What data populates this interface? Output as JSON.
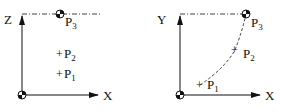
{
  "left_panel": {
    "axis_vertical": "Z",
    "axis_horizontal": "X",
    "points": [
      {
        "label": "P",
        "sub": "1",
        "marker": "plus"
      },
      {
        "label": "P",
        "sub": "2",
        "marker": "plus"
      },
      {
        "label": "P",
        "sub": "3",
        "marker": "target"
      }
    ]
  },
  "right_panel": {
    "axis_vertical": "Y",
    "axis_horizontal": "X",
    "points": [
      {
        "label": "P",
        "sub": "1",
        "marker": "plus"
      },
      {
        "label": "P",
        "sub": "2",
        "marker": "plus"
      },
      {
        "label": "P",
        "sub": "3",
        "marker": "target"
      }
    ]
  },
  "colors": {
    "ink": "#111111",
    "background": "#ffffff"
  }
}
